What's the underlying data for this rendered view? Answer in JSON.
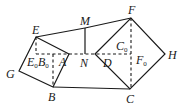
{
  "diagram": {
    "type": "geometry",
    "points": {
      "E": {
        "label": "E",
        "x": 36,
        "y": 37
      },
      "M": {
        "label": "M",
        "x": 85,
        "y": 28
      },
      "F": {
        "label": "F",
        "x": 131,
        "y": 18
      },
      "G": {
        "label": "G",
        "x": 19,
        "y": 71
      },
      "B": {
        "label": "B",
        "x": 53,
        "y": 87
      },
      "C": {
        "label": "C",
        "x": 130,
        "y": 89
      },
      "H": {
        "label": "H",
        "x": 165,
        "y": 54
      },
      "A": {
        "label": "A",
        "x": 69,
        "y": 54
      },
      "N": {
        "label": "N",
        "x": 85,
        "y": 54
      },
      "D": {
        "label": "D",
        "x": 95,
        "y": 54
      }
    },
    "labels": {
      "E": "E",
      "M": "M",
      "F": "F",
      "G": "G",
      "B": "B",
      "C": "C",
      "H": "H",
      "A": "A",
      "N": "N",
      "D": "D",
      "E0": "E",
      "E0_sub": "0",
      "B0": "B",
      "B0_sub": "0",
      "C0": "C",
      "C0_sub": "0",
      "F0": "F",
      "F0_sub": "0"
    },
    "solid_segments": [
      "E-M",
      "M-F",
      "M-N",
      "E-A",
      "A-B",
      "B-G",
      "G-E",
      "B-C",
      "D-F",
      "F-H",
      "H-C",
      "C-D"
    ],
    "dashed_segments": [
      "E0-F0 (horizontal through A, N, D)",
      "E-E0",
      "B0-B",
      "F-C"
    ]
  }
}
